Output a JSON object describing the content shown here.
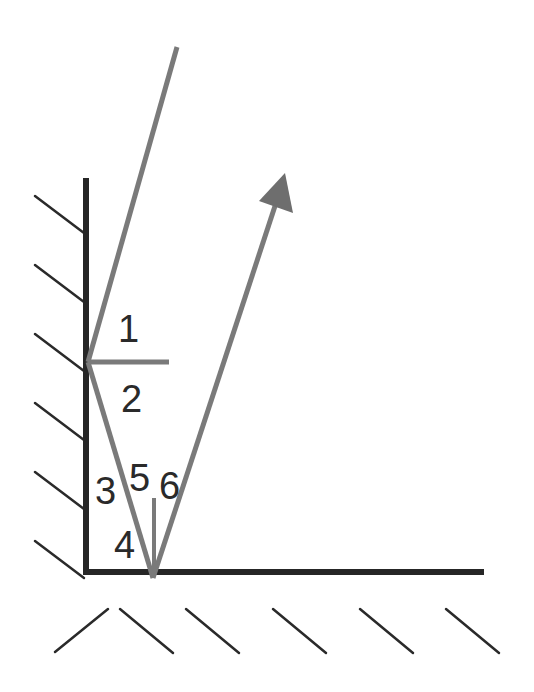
{
  "diagram": {
    "colors": {
      "mirror": "#262626",
      "hatch": "#2a2a2a",
      "ray": "#7a7a7a",
      "label": "#2a2a2a",
      "background": "#ffffff"
    },
    "angle_labels": [
      "1",
      "2",
      "3",
      "5",
      "6",
      "4"
    ],
    "elements": {
      "vertical_mirror": "vertical mirror",
      "horizontal_mirror": "horizontal mirror",
      "incident_ray": "incident ray",
      "intermediate_ray": "reflected ray between mirrors",
      "outgoing_ray": "outgoing ray with arrow",
      "normal_vertical_mirror": "normal to vertical mirror",
      "normal_horizontal_mirror": "normal to horizontal mirror"
    }
  }
}
